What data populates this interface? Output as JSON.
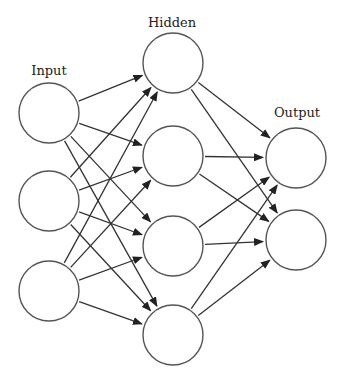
{
  "diagram": {
    "type": "neural-network",
    "labels": {
      "input": "Input",
      "hidden": "Hidden",
      "output": "Output"
    },
    "layers": [
      {
        "name": "input",
        "nodes": [
          {
            "x": 49,
            "y": 113
          },
          {
            "x": 49,
            "y": 201
          },
          {
            "x": 49,
            "y": 291
          }
        ]
      },
      {
        "name": "hidden",
        "nodes": [
          {
            "x": 173,
            "y": 63
          },
          {
            "x": 173,
            "y": 156
          },
          {
            "x": 173,
            "y": 246
          },
          {
            "x": 173,
            "y": 335
          }
        ]
      },
      {
        "name": "output",
        "nodes": [
          {
            "x": 296,
            "y": 158
          },
          {
            "x": 296,
            "y": 240
          }
        ]
      }
    ],
    "node_radius": 30,
    "connections": "fully-connected, directed left to right",
    "colors": {
      "stroke": "#555555",
      "edge": "#333333",
      "background": "#ffffff",
      "text": "#222222"
    }
  }
}
